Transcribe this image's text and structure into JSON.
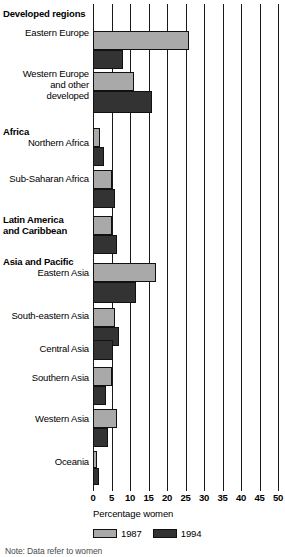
{
  "chart_data": {
    "type": "bar",
    "orientation": "horizontal",
    "title": "",
    "xlabel": "Percentage women",
    "ylabel": "",
    "xlim": [
      0,
      50
    ],
    "xticks": [
      0,
      5,
      10,
      15,
      20,
      25,
      30,
      35,
      40,
      45,
      50
    ],
    "grid": true,
    "legend_position": "bottom",
    "colors": {
      "1987": "#a9a9a9",
      "1994": "#333333",
      "axis": "#1a1a1a",
      "background": "#ffffff"
    },
    "series": [
      {
        "name": "1987",
        "values": [
          26.0,
          11.0,
          2.0,
          5.0,
          5.0,
          17.0,
          6.0,
          null,
          5.0,
          6.5,
          1.0
        ]
      },
      {
        "name": "1994",
        "values": [
          8.0,
          16.0,
          3.0,
          6.0,
          6.5,
          11.5,
          7.0,
          5.5,
          3.5,
          4.0,
          1.5
        ]
      }
    ],
    "categories": [
      "Eastern Europe",
      "Western Europe and other developed",
      "Northern Africa",
      "Sub-Saharan Africa",
      "Latin America and Caribbean",
      "Eastern Asia",
      "South-eastern Asia",
      "Central Asia",
      "Southern Asia",
      "Western Asia",
      "Oceania"
    ],
    "groups": [
      {
        "name": "Developed regions",
        "categories": [
          "Eastern Europe",
          "Western Europe and other developed"
        ]
      },
      {
        "name": "Africa",
        "categories": [
          "Northern Africa",
          "Sub-Saharan Africa"
        ]
      },
      {
        "name": "Latin America and Caribbean",
        "categories": []
      },
      {
        "name": "Asia and Pacific",
        "categories": [
          "Eastern Asia",
          "South-eastern Asia",
          "Central Asia",
          "Southern Asia",
          "Western Asia",
          "Oceania"
        ]
      }
    ]
  },
  "group_headers": [
    {
      "label": "Developed regions",
      "top": 8
    },
    {
      "label": "Africa",
      "top": 126
    },
    {
      "label": "Latin America",
      "top": 214
    },
    {
      "label": "and Caribbean",
      "top": 225
    },
    {
      "label": "Asia and Pacific",
      "top": 256
    }
  ],
  "category_labels": [
    {
      "label": "Eastern Europe",
      "top": 27
    },
    {
      "label": "Western Europe",
      "top": 68
    },
    {
      "label": "and other",
      "top": 79
    },
    {
      "label": "developed",
      "top": 90
    },
    {
      "label": "Northern Africa",
      "top": 137
    },
    {
      "label": "Sub-Saharan Africa",
      "top": 173
    },
    {
      "label": "Eastern Asia",
      "top": 267
    },
    {
      "label": "South-eastern Asia",
      "top": 310
    },
    {
      "label": "Central Asia",
      "top": 343
    },
    {
      "label": "Southern Asia",
      "top": 372
    },
    {
      "label": "Western Asia",
      "top": 413
    },
    {
      "label": "Oceania",
      "top": 456
    }
  ],
  "bars": [
    {
      "name": "eastern-europe-1987",
      "series": "1987",
      "value": 26.0,
      "top": 31,
      "height": 19
    },
    {
      "name": "eastern-europe-1994",
      "series": "1994",
      "value": 8.0,
      "top": 50,
      "height": 19
    },
    {
      "name": "western-europe-1987",
      "series": "1987",
      "value": 11.0,
      "top": 72,
      "height": 19
    },
    {
      "name": "western-europe-1994",
      "series": "1994",
      "value": 16.0,
      "top": 91,
      "height": 22
    },
    {
      "name": "northern-africa-1987",
      "series": "1987",
      "value": 2.0,
      "top": 128,
      "height": 19
    },
    {
      "name": "northern-africa-1994",
      "series": "1994",
      "value": 3.0,
      "top": 147,
      "height": 19
    },
    {
      "name": "sub-saharan-africa-1987",
      "series": "1987",
      "value": 5.0,
      "top": 170,
      "height": 19
    },
    {
      "name": "sub-saharan-africa-1994",
      "series": "1994",
      "value": 6.0,
      "top": 189,
      "height": 19
    },
    {
      "name": "latin-america-1987",
      "series": "1987",
      "value": 5.0,
      "top": 216,
      "height": 19
    },
    {
      "name": "latin-america-1994",
      "series": "1994",
      "value": 6.5,
      "top": 235,
      "height": 19
    },
    {
      "name": "eastern-asia-1987",
      "series": "1987",
      "value": 17.0,
      "top": 263,
      "height": 19
    },
    {
      "name": "eastern-asia-1994",
      "series": "1994",
      "value": 11.5,
      "top": 282,
      "height": 21
    },
    {
      "name": "south-eastern-asia-1987",
      "series": "1987",
      "value": 6.0,
      "top": 308,
      "height": 19
    },
    {
      "name": "south-eastern-asia-1994",
      "series": "1994",
      "value": 7.0,
      "top": 327,
      "height": 19
    },
    {
      "name": "central-asia-1994",
      "series": "1994",
      "value": 5.5,
      "top": 340,
      "height": 20
    },
    {
      "name": "southern-asia-1987",
      "series": "1987",
      "value": 5.0,
      "top": 367,
      "height": 19
    },
    {
      "name": "southern-asia-1994",
      "series": "1994",
      "value": 3.5,
      "top": 386,
      "height": 19
    },
    {
      "name": "western-asia-1987",
      "series": "1987",
      "value": 6.5,
      "top": 409,
      "height": 19
    },
    {
      "name": "western-asia-1994",
      "series": "1994",
      "value": 4.0,
      "top": 428,
      "height": 19
    },
    {
      "name": "oceania-1987",
      "series": "1987",
      "value": 1.0,
      "top": 451,
      "height": 17
    },
    {
      "name": "oceania-1994",
      "series": "1994",
      "value": 1.5,
      "top": 468,
      "height": 17
    }
  ],
  "axis": {
    "title": "Percentage women",
    "tick_labels": [
      "0",
      "5",
      "10",
      "15",
      "20",
      "25",
      "30",
      "35",
      "40",
      "45",
      "50"
    ]
  },
  "legend": {
    "items": [
      {
        "label": "1987",
        "swatch": "s1987"
      },
      {
        "label": "1994",
        "swatch": "s1994"
      }
    ]
  },
  "footnote": {
    "text": "Note: Data refer to women"
  }
}
